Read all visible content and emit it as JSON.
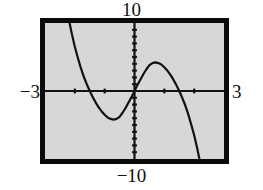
{
  "figure": {
    "kind": "graphing-calculator-screen",
    "screen_bg_color": "#d7d7d7",
    "bezel_color": "#0b0b0b",
    "ink_color": "#111111"
  },
  "window_labels": {
    "ymax": "10",
    "ymin": "−10",
    "xmin": "−3",
    "xmax": "3"
  },
  "chart_data": {
    "type": "line",
    "title": "",
    "subtitle": "",
    "xlabel": "",
    "ylabel": "",
    "xlim": [
      -3,
      3
    ],
    "ylim": [
      -10,
      10
    ],
    "grid": false,
    "legend": null,
    "axes": {
      "x_axis_drawn": true,
      "y_axis_drawn": true,
      "x_tick_step": 1,
      "y_tick_step": 1,
      "x_ticks": [
        -2,
        -1,
        1,
        2
      ],
      "y_ticks": [
        -9,
        -8,
        -7,
        -6,
        -5,
        -4,
        -3,
        -2,
        -1,
        1,
        2,
        3,
        4,
        5,
        6,
        7,
        8,
        9
      ]
    },
    "annotations": [
      {
        "text": "10",
        "position": "above-screen",
        "meaning": "Ymax"
      },
      {
        "text": "−10",
        "position": "below-screen",
        "meaning": "Ymin"
      },
      {
        "text": "−3",
        "position": "left-of-screen",
        "meaning": "Xmin"
      },
      {
        "text": "3",
        "position": "right-of-screen",
        "meaning": "Xmax"
      }
    ],
    "series": [
      {
        "name": "curve",
        "style": "solid",
        "color": "#111111",
        "roots_x": [
          -1.55,
          0,
          1.55
        ],
        "local_min": {
          "x": -0.92,
          "y": -4.3
        },
        "local_max": {
          "x": 0.92,
          "y": 4.3
        },
        "x": [
          -2.58,
          -2.5,
          -2.4,
          -2.3,
          -2.2,
          -2.1,
          -2.0,
          -1.9,
          -1.8,
          -1.7,
          -1.6,
          -1.5,
          -1.4,
          -1.3,
          -1.2,
          -1.1,
          -1.0,
          -0.9,
          -0.8,
          -0.7,
          -0.6,
          -0.5,
          -0.4,
          -0.3,
          -0.2,
          -0.1,
          0.0,
          0.1,
          0.2,
          0.3,
          0.4,
          0.5,
          0.6,
          0.7,
          0.8,
          0.9,
          1.0,
          1.1,
          1.2,
          1.3,
          1.4,
          1.5,
          1.6,
          1.7,
          1.8,
          1.9,
          2.0,
          2.1,
          2.2,
          2.3,
          2.4
        ],
        "y": [
          20.9,
          18.2,
          15.4,
          12.8,
          10.5,
          8.4,
          6.5,
          4.9,
          3.4,
          2.1,
          1.0,
          0.0,
          -0.9,
          -1.7,
          -2.4,
          -3.0,
          -3.5,
          -3.9,
          -4.1,
          -4.2,
          -4.1,
          -3.8,
          -3.2,
          -2.5,
          -1.7,
          -0.9,
          0.0,
          0.9,
          1.7,
          2.5,
          3.2,
          3.8,
          4.1,
          4.2,
          4.1,
          3.9,
          3.5,
          3.0,
          2.4,
          1.7,
          0.9,
          0.0,
          -1.0,
          -2.1,
          -3.4,
          -4.9,
          -6.5,
          -8.4,
          -10.5,
          -12.8,
          -15.4
        ]
      }
    ]
  }
}
